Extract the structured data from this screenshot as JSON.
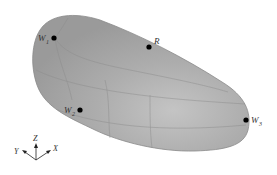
{
  "figure": {
    "surface_color": "#a8a8a8",
    "edge_color": "#7a7a7a",
    "points": [
      {
        "id": "W1",
        "label": "W",
        "subscript": "1"
      },
      {
        "id": "R",
        "label": "R",
        "subscript": ""
      },
      {
        "id": "W2",
        "label": "W",
        "subscript": "2"
      },
      {
        "id": "W3",
        "label": "W",
        "subscript": "3"
      }
    ],
    "axes": {
      "z": "Z",
      "y": "Y",
      "x": "X"
    }
  }
}
